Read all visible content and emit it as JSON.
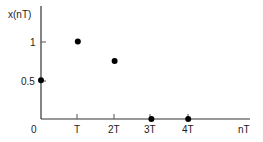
{
  "chart_data": {
    "type": "scatter",
    "title": "",
    "xlabel": "nT",
    "ylabel": "x(nT)",
    "categories": [
      "0",
      "T",
      "2T",
      "3T",
      "4T"
    ],
    "x": [
      0,
      1,
      2,
      3,
      4
    ],
    "values": [
      0.5,
      1,
      0.75,
      0,
      0
    ],
    "y_ticks": [
      "0.5",
      "1"
    ],
    "origin_label": "0",
    "ylim": [
      0,
      1.3
    ],
    "grid": false,
    "legend": null
  },
  "style": {
    "axis_color": "#333333",
    "point_color": "#000000"
  }
}
